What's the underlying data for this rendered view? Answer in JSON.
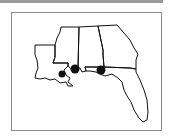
{
  "map": {
    "region": "US Gulf Coast",
    "states": [
      "Louisiana",
      "Mississippi",
      "Alabama",
      "Georgia",
      "Florida"
    ],
    "markers": [
      {
        "id": "marker-1",
        "approx_location": "New Orleans area",
        "x": 62,
        "y": 74,
        "r": 3.5
      },
      {
        "id": "marker-2",
        "approx_location": "Mississippi coast",
        "x": 75,
        "y": 69,
        "r": 4.5
      },
      {
        "id": "marker-3",
        "approx_location": "Pensacola area",
        "x": 101,
        "y": 70,
        "r": 4.5
      }
    ],
    "colors": {
      "outline": "#111111",
      "marker": "#111111",
      "frame": "#8a8a8a",
      "background": "#ffffff"
    }
  }
}
